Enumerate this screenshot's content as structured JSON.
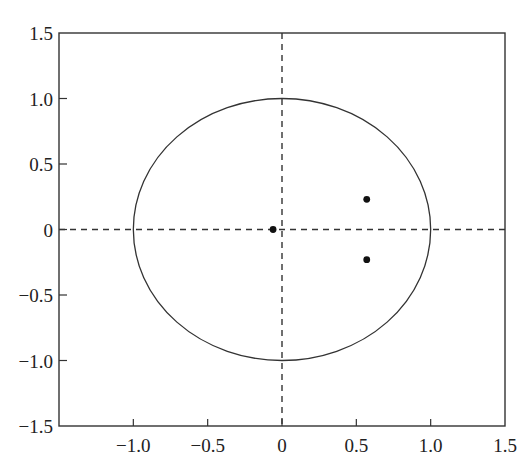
{
  "chart_data": {
    "type": "scatter",
    "title": "",
    "xlabel": "",
    "ylabel": "",
    "xlim": [
      -1.5,
      1.5
    ],
    "ylim": [
      -1.5,
      1.5
    ],
    "grid": false,
    "legend": null,
    "x_ticks": [
      -1.0,
      -0.5,
      0,
      0.5,
      1.0,
      1.5
    ],
    "x_tick_labels": [
      "−1.0",
      "−0.5",
      "0",
      "0.5",
      "1.0",
      "1.5"
    ],
    "y_ticks": [
      1.5,
      1.0,
      0.5,
      0,
      -0.5,
      -1.0,
      -1.5
    ],
    "y_tick_labels": [
      "1.5",
      "1.0",
      "0.5",
      "0",
      "−0.5",
      "−1.0",
      "−1.5"
    ],
    "series": [
      {
        "name": "unit circle",
        "kind": "curve",
        "center": [
          0,
          0
        ],
        "radius": 1.0,
        "style": "solid"
      },
      {
        "name": "real axis",
        "kind": "line",
        "y": 0,
        "style": "dashed"
      },
      {
        "name": "imaginary axis",
        "kind": "line",
        "x": 0,
        "style": "dashed"
      },
      {
        "name": "poles",
        "kind": "points",
        "x": [
          -0.06,
          0.57,
          0.57
        ],
        "y": [
          0.0,
          0.23,
          -0.23
        ]
      }
    ]
  },
  "colors": {
    "line": "#333333",
    "point": "#111111",
    "background": "#ffffff"
  }
}
